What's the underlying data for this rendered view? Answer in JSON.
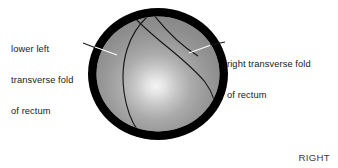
{
  "figure": {
    "type": "anatomical-illustration",
    "background_color": "#ffffff"
  },
  "annotations": {
    "left": {
      "name": "lower-left-transverse-fold-label",
      "lines": [
        "lower left",
        "transverse fold",
        "of rectum"
      ],
      "text": "lower left transverse fold of rectum",
      "leader_color": "#ffffff"
    },
    "right": {
      "name": "right-transverse-fold-label",
      "lines": [
        "right transverse fold",
        "of rectum"
      ],
      "text": "right transverse fold of rectum",
      "leader_color": "#ffffff"
    }
  },
  "orientation": {
    "label": "RIGHT"
  },
  "illustration": {
    "outer_ring_color": "#000000",
    "lumen_color": "#8f8f8f",
    "lumen_highlight_color": "#f2f2f2",
    "fold_line_color": "#1a1a1a",
    "ellipse": {
      "center_x": 158,
      "center_y": 74,
      "radius_x": 70,
      "radius_y": 66,
      "ring_thickness": 9
    },
    "highlight": {
      "center_x": 155,
      "center_y": 89,
      "radius": 58
    },
    "folds": [
      {
        "name": "left-fold-curve",
        "description": "lower left transverse fold arc sweeping from upper area down to lower left of lumen"
      },
      {
        "name": "right-fold-curve",
        "description": "right transverse fold arc sweeping from upper left across to lower right of lumen"
      }
    ]
  }
}
